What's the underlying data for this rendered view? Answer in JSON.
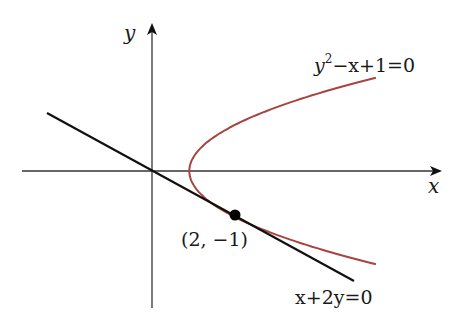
{
  "diagram": {
    "axes": {
      "x_label": "x",
      "y_label": "y",
      "origin_px": [
        152,
        171
      ],
      "x_scale_px": 41.5,
      "y_scale_px": 44
    },
    "curve": {
      "equation": "y²−x+1=0",
      "eq_y": "y",
      "eq_exp": "2",
      "eq_rest": "−x+1=0",
      "color": "#a8443f"
    },
    "line": {
      "equation": "x+2y=0",
      "color": "#111111"
    },
    "tangent_point": {
      "label": "(2, −1)",
      "x": 2,
      "y": -1
    },
    "colors": {
      "axis": "#333333",
      "background": "#ffffff"
    }
  }
}
